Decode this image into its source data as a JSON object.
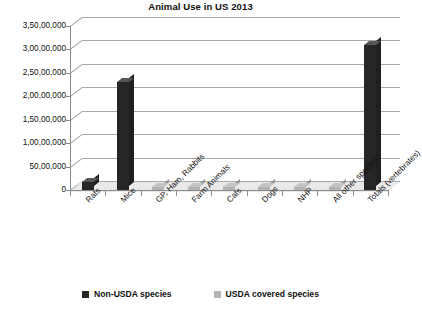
{
  "chart_data": {
    "type": "bar",
    "title": "Animal Use in US 2013",
    "xlabel": "",
    "ylabel": "",
    "ylim": [
      0,
      35000000
    ],
    "grid": true,
    "legend_position": "bottom",
    "categories": [
      "Rats",
      "Mice",
      "GP, Ham, Rabbits",
      "Farm Animals",
      "Cats",
      "Dogs",
      "NHP",
      "All other species",
      "Totals (vertebrates)"
    ],
    "ytick_labels": [
      "0",
      "50,00,000",
      "1,00,00,000",
      "1,50,00,000",
      "2,00,00,000",
      "2,50,00,000",
      "3,00,00,000",
      "3,50,00,000"
    ],
    "ytick_values": [
      0,
      5000000,
      10000000,
      15000000,
      20000000,
      25000000,
      30000000,
      35000000
    ],
    "series": [
      {
        "name": "Non-USDA species",
        "color": "#262626",
        "values": [
          1800000,
          23000000,
          0,
          0,
          0,
          0,
          0,
          0,
          31000000
        ]
      },
      {
        "name": "USDA covered species",
        "color": "#b3b3b3",
        "values": [
          0,
          0,
          500000,
          400000,
          300000,
          200000,
          200000,
          300000,
          0
        ]
      }
    ]
  },
  "legend": {
    "items": [
      {
        "label": "Non-USDA species",
        "color": "#262626"
      },
      {
        "label": "USDA covered species",
        "color": "#b3b3b3"
      }
    ]
  },
  "colors": {
    "series_dark": "#262626",
    "series_light": "#b3b3b3",
    "gridline": "#a9a9a9",
    "axis": "#8a8a8a",
    "floor": "#e9e9e9",
    "text": "#111111",
    "background": "#ffffff"
  }
}
